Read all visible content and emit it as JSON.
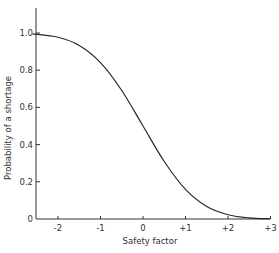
{
  "chart_data": {
    "type": "line",
    "title": "",
    "xlabel": "Safety factor",
    "ylabel": "Probability of a shortage",
    "xlim": [
      -2.6,
      3
    ],
    "ylim": [
      0,
      1.1
    ],
    "grid": false,
    "legend": null,
    "x_ticks": [
      {
        "value": -2,
        "label": "-2"
      },
      {
        "value": -1,
        "label": "-1"
      },
      {
        "value": 0,
        "label": "0"
      },
      {
        "value": 1,
        "label": "+1"
      },
      {
        "value": 2,
        "label": "+2"
      },
      {
        "value": 3,
        "label": "+3"
      }
    ],
    "y_ticks": [
      {
        "value": 0,
        "label": "0"
      },
      {
        "value": 0.2,
        "label": "0.2"
      },
      {
        "value": 0.4,
        "label": "0.4"
      },
      {
        "value": 0.6,
        "label": "0.6"
      },
      {
        "value": 0.8,
        "label": "0.8"
      },
      {
        "value": 1.0,
        "label": "1.0"
      }
    ],
    "series": [
      {
        "name": "Probability of a shortage",
        "x": [
          -2.6,
          -2.0,
          -1.5,
          -1.0,
          -0.5,
          0.0,
          0.5,
          1.0,
          1.5,
          2.0,
          2.5,
          3.0
        ],
        "y": [
          0.995,
          0.977,
          0.933,
          0.841,
          0.691,
          0.5,
          0.309,
          0.159,
          0.067,
          0.023,
          0.006,
          0.001
        ]
      }
    ],
    "line_color": "#2a2a2a"
  }
}
